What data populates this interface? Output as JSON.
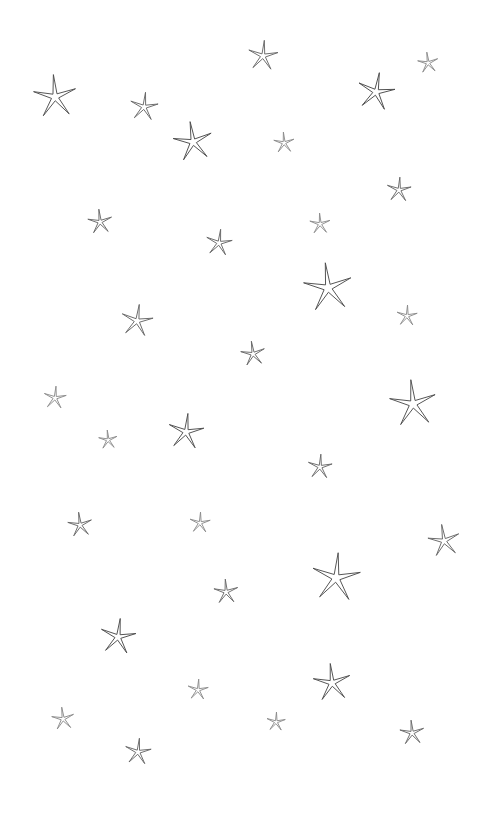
{
  "canvas": {
    "width": 489,
    "height": 816,
    "background_color": "#ffffff",
    "title": "Scattered hand-drawn outline stars"
  },
  "style": {
    "stroke_color_dark": "#4a4a4a",
    "stroke_color_mid": "#666666",
    "stroke_color_light": "#8a8a8a",
    "stroke_width": 0.9,
    "fill": "none",
    "shape": "five-point-star-outline"
  },
  "motif": {
    "name": "star",
    "points": 5,
    "inner_radius_ratio": 0.17,
    "description": "Thin spiky five-pointed star drawn as a closed outline, like a starfish sketch"
  },
  "stars": [
    {
      "id": 1,
      "x": 55,
      "y": 97,
      "size": 46,
      "rotation": -4,
      "tone": "dark"
    },
    {
      "id": 2,
      "x": 144,
      "y": 107,
      "size": 30,
      "tone": "mid",
      "rotation": 6
    },
    {
      "id": 3,
      "x": 193,
      "y": 142,
      "size": 42,
      "tone": "dark",
      "rotation": -8
    },
    {
      "id": 4,
      "x": 263,
      "y": 56,
      "size": 32,
      "tone": "mid",
      "rotation": 5
    },
    {
      "id": 5,
      "x": 284,
      "y": 143,
      "size": 22,
      "tone": "light",
      "rotation": -3
    },
    {
      "id": 6,
      "x": 376,
      "y": 92,
      "size": 40,
      "tone": "dark",
      "rotation": 10
    },
    {
      "id": 7,
      "x": 428,
      "y": 63,
      "size": 22,
      "tone": "light",
      "rotation": -6
    },
    {
      "id": 8,
      "x": 399,
      "y": 190,
      "size": 26,
      "tone": "mid",
      "rotation": 4
    },
    {
      "id": 9,
      "x": 100,
      "y": 222,
      "size": 26,
      "tone": "mid",
      "rotation": -5
    },
    {
      "id": 10,
      "x": 219,
      "y": 243,
      "size": 28,
      "tone": "mid",
      "rotation": 7
    },
    {
      "id": 11,
      "x": 320,
      "y": 224,
      "size": 22,
      "tone": "light",
      "rotation": -2
    },
    {
      "id": 12,
      "x": 328,
      "y": 288,
      "size": 52,
      "tone": "dark",
      "rotation": -6
    },
    {
      "id": 13,
      "x": 137,
      "y": 321,
      "size": 34,
      "tone": "mid",
      "rotation": 8
    },
    {
      "id": 14,
      "x": 407,
      "y": 316,
      "size": 22,
      "tone": "light",
      "rotation": 3
    },
    {
      "id": 15,
      "x": 253,
      "y": 354,
      "size": 26,
      "tone": "mid",
      "rotation": -7
    },
    {
      "id": 16,
      "x": 55,
      "y": 398,
      "size": 24,
      "tone": "light",
      "rotation": 5
    },
    {
      "id": 17,
      "x": 413,
      "y": 404,
      "size": 50,
      "tone": "dark",
      "rotation": -5
    },
    {
      "id": 18,
      "x": 186,
      "y": 432,
      "size": 38,
      "tone": "dark",
      "rotation": 6
    },
    {
      "id": 19,
      "x": 108,
      "y": 440,
      "size": 20,
      "tone": "light",
      "rotation": -4
    },
    {
      "id": 20,
      "x": 320,
      "y": 467,
      "size": 26,
      "tone": "mid",
      "rotation": 4
    },
    {
      "id": 21,
      "x": 80,
      "y": 525,
      "size": 26,
      "tone": "mid",
      "rotation": -6
    },
    {
      "id": 22,
      "x": 200,
      "y": 523,
      "size": 22,
      "tone": "light",
      "rotation": 3
    },
    {
      "id": 23,
      "x": 444,
      "y": 541,
      "size": 34,
      "tone": "mid",
      "rotation": -8
    },
    {
      "id": 24,
      "x": 336,
      "y": 578,
      "size": 52,
      "tone": "dark",
      "rotation": 5
    },
    {
      "id": 25,
      "x": 226,
      "y": 592,
      "size": 26,
      "tone": "mid",
      "rotation": -3
    },
    {
      "id": 26,
      "x": 118,
      "y": 637,
      "size": 38,
      "tone": "dark",
      "rotation": 7
    },
    {
      "id": 27,
      "x": 332,
      "y": 683,
      "size": 40,
      "tone": "dark",
      "rotation": -5
    },
    {
      "id": 28,
      "x": 198,
      "y": 690,
      "size": 22,
      "tone": "light",
      "rotation": 4
    },
    {
      "id": 29,
      "x": 63,
      "y": 719,
      "size": 24,
      "tone": "light",
      "rotation": -6
    },
    {
      "id": 30,
      "x": 276,
      "y": 722,
      "size": 20,
      "tone": "light",
      "rotation": 3
    },
    {
      "id": 31,
      "x": 412,
      "y": 733,
      "size": 26,
      "tone": "mid",
      "rotation": -4
    },
    {
      "id": 32,
      "x": 138,
      "y": 752,
      "size": 28,
      "tone": "mid",
      "rotation": 6
    }
  ]
}
